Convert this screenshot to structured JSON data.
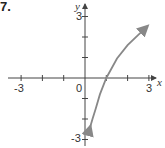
{
  "problem_number": "7.",
  "chart_data": {
    "type": "line",
    "title": "",
    "xlabel": "x",
    "ylabel": "y",
    "xlim": [
      -3.6,
      3.6
    ],
    "ylim": [
      -3.2,
      3.5
    ],
    "x_tick_labels": [
      "-3",
      "0",
      "3"
    ],
    "y_tick_labels": [
      "3",
      "-3"
    ],
    "x_ticks": [
      -3,
      -2,
      -1,
      0,
      1,
      2,
      3
    ],
    "y_ticks": [
      -3,
      -2,
      -1,
      1,
      2,
      3
    ],
    "grid": false,
    "series": [
      {
        "name": "curve",
        "description": "increasing logarithmic curve through (1, 0), arrows at both ends",
        "x": [
          0.24,
          0.35,
          0.5,
          0.7,
          1.0,
          1.5,
          2.0,
          2.5,
          2.9
        ],
        "values": [
          -2.4,
          -2.0,
          -1.5,
          -0.8,
          0.0,
          0.95,
          1.6,
          2.1,
          2.5
        ],
        "color": "#888888"
      }
    ]
  }
}
